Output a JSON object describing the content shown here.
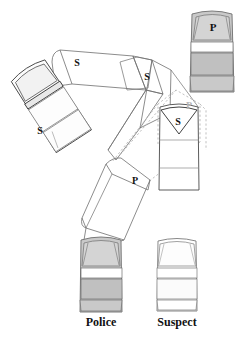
{
  "figure": {
    "type": "accident-reconstruction-diagram",
    "title": "",
    "width": 242,
    "height": 338,
    "background": "#ffffff"
  },
  "colors": {
    "police_body_fill": "#c9c9c9",
    "police_window_fill": "#d8d8d8",
    "suspect_body_fill": "#ffffff",
    "suspect_window_fill": "#fbfbfb",
    "outline_dark": "#3c3c3c",
    "outline_mid": "#8a8a8a",
    "outline_light": "#b0b0b0",
    "trajectory_solid": "#6e6e6e",
    "trajectory_dashed": "#b9b9b9",
    "label_dark": "#111111",
    "label_faint": "#b5b5b5"
  },
  "legend": {
    "items": [
      {
        "key": "police",
        "label": "Police",
        "marker": "P",
        "shaded": true,
        "x": 101,
        "y": 322
      },
      {
        "key": "suspect",
        "label": "Suspect",
        "marker": "S",
        "shaded": false,
        "x": 177,
        "y": 322
      }
    ]
  },
  "vehicles": [
    {
      "id": "police-final-top-right",
      "actor": "police",
      "marker": "P",
      "shaded": true,
      "center": [
        212,
        51
      ],
      "rotation": 0,
      "width": 42,
      "height": 86,
      "marker_pos": [
        213,
        27
      ],
      "marker_color": "#111111",
      "marker_size": 11
    },
    {
      "id": "suspect-final-center-right",
      "actor": "suspect",
      "marker": "S",
      "shaded": false,
      "center": [
        179,
        148
      ],
      "rotation": 0,
      "width": 40,
      "height": 84,
      "marker_pos": [
        178,
        121
      ],
      "marker_color": "#111111",
      "marker_size": 10
    },
    {
      "id": "suspect-impact-upper-left",
      "actor": "suspect",
      "marker": "S",
      "shaded": false,
      "center": [
        51,
        106
      ],
      "rotation": -33,
      "width": 40,
      "height": 86,
      "marker_pos": [
        40,
        131
      ],
      "marker_color": "#111111",
      "marker_size": 10
    },
    {
      "id": "police-start-bottom-left",
      "actor": "police",
      "marker": "P",
      "shaded": true,
      "center": [
        101,
        272
      ],
      "rotation": 0,
      "width": 40,
      "height": 84,
      "marker_pos": null,
      "marker_color": "#111111",
      "marker_size": 10
    },
    {
      "id": "suspect-start-bottom-right",
      "actor": "suspect",
      "marker": "S",
      "shaded": false,
      "center": [
        177,
        272
      ],
      "rotation": 0,
      "width": 38,
      "height": 82,
      "marker_pos": null,
      "marker_color": "#111111",
      "marker_size": 10
    }
  ],
  "trajectories": [
    {
      "id": "suspect-path-upper",
      "actor": "suspect",
      "marker": "S",
      "style": "solid",
      "stroke": "#6e6e6e",
      "marker_positions": [
        [
          77,
          62
        ],
        [
          147,
          76
        ]
      ],
      "marker_color": "#111111",
      "marker_size": 10
    },
    {
      "id": "suspect-path-descending",
      "actor": "suspect",
      "marker": "S",
      "style": "solid",
      "stroke": "#6e6e6e",
      "marker_positions": [],
      "marker_color": "#111111",
      "marker_size": 10
    },
    {
      "id": "police-path-dashed-upper",
      "actor": "police",
      "marker": "P",
      "style": "dashed",
      "stroke": "#b9b9b9",
      "marker_positions": [
        [
          188,
          108
        ]
      ],
      "marker_color": "#b5b5b5",
      "marker_size": 10
    },
    {
      "id": "police-path-lower",
      "actor": "police",
      "marker": "P",
      "style": "solid",
      "stroke": "#6e6e6e",
      "marker_positions": [
        [
          135,
          180
        ]
      ],
      "marker_color": "#111111",
      "marker_size": 10
    }
  ],
  "markers": {
    "police_symbol": "P",
    "suspect_symbol": "S"
  }
}
